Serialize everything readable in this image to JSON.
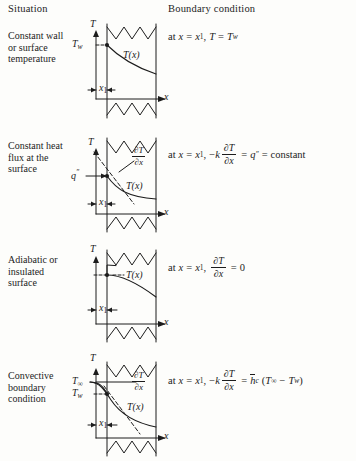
{
  "header": {
    "situation": "Situation",
    "boundary_condition": "Boundary condition"
  },
  "rows": [
    {
      "situation": "Constant wall or surface temperature",
      "equation_text": "at x = x1, T = Tw",
      "diagram_labels": {
        "t_axis": "T",
        "x_axis": "x",
        "x1": "x1",
        "profile": "T(x)",
        "wall_temp": "Tw"
      }
    },
    {
      "situation": "Constant heat flux at the surface",
      "equation_text": "at x = x1, -k ∂T/∂x = q″ = constant",
      "diagram_labels": {
        "t_axis": "T",
        "x_axis": "x",
        "x1": "x1",
        "profile": "T(x)",
        "flux": "q″",
        "gradient": "∂T/∂x"
      }
    },
    {
      "situation": "Adiabatic or insulated surface",
      "equation_text": "at x = x1, ∂T/∂x = 0",
      "diagram_labels": {
        "t_axis": "T",
        "x_axis": "x",
        "x1": "x1",
        "profile": "T(x)"
      }
    },
    {
      "situation": "Convective boundary condition",
      "equation_text": "at x = x1, -k ∂T/∂x = hc (T∞ - Tw)",
      "diagram_labels": {
        "t_axis": "T",
        "x_axis": "x",
        "x1": "x1",
        "profile": "T(x)",
        "gradient": "∂T/∂x",
        "t_inf": "T∞",
        "t_wall": "Tw"
      }
    }
  ],
  "symbols": {
    "at": "at",
    "x": "x",
    "equals": "=",
    "x_sub1": "1",
    "T": "T",
    "w": "w",
    "minus": "−",
    "k": "k",
    "partial": "∂",
    "q": "q",
    "dprime": "″",
    "constant": "constant",
    "zero": "0",
    "h": "h",
    "c": "c",
    "infinity": "∞",
    "lparen": "(",
    "rparen": ")",
    "comma": ","
  },
  "colors": {
    "ink": "#1c1c1c",
    "paper": "#fdfdfb"
  }
}
